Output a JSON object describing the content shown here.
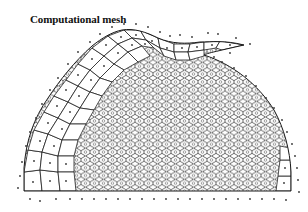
{
  "figure": {
    "title": "Computational mesh",
    "colors": {
      "background": "#ffffff",
      "lines": "#222222",
      "points": "#333333"
    },
    "mesh": {
      "type": "voronoi",
      "cell_shape": "hexagonal interior, irregular near boundary",
      "domain_shape": "half-dome",
      "has_center_points": true,
      "has_boundary_points": true
    }
  }
}
